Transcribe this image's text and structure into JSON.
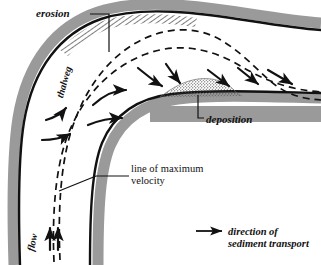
{
  "figure": {
    "type": "river-meander-cross-section-diagram",
    "background_color": "#ffffff",
    "ink_color": "#111111",
    "bank_gray": "#9a9a9a",
    "stipple_gray": "#6b6b6b"
  },
  "labels": {
    "erosion": "erosion",
    "deposition": "deposition",
    "thalweg": "thalweg",
    "flow": "flow",
    "max_velocity_line1": "line of maximum",
    "max_velocity_line2": "velocity"
  },
  "legend": {
    "symbol": "arrow-right-icon",
    "text_line1": "direction of",
    "text_line2": "sediment transport"
  },
  "features": {
    "erosion_zone": {
      "name": "erosion-hatching",
      "pattern": "diagonal-hatch",
      "bank": "outer-bank"
    },
    "deposition_zone": {
      "name": "deposition-stipple",
      "pattern": "stipple-dots",
      "bank": "inner-bank"
    },
    "thalweg_line": {
      "name": "thalweg-dashed-line",
      "style": "dashed"
    },
    "max_velocity_line": {
      "name": "max-velocity-dashed-line",
      "style": "dashed"
    },
    "sediment_arrows_count": 9,
    "flow_arrows_count": 3
  }
}
